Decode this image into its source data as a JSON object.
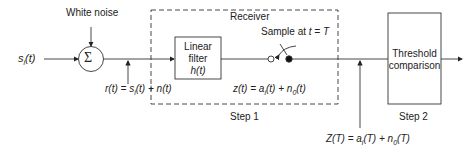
{
  "labels": {
    "white_noise": "White noise",
    "input_signal": "s",
    "input_sub": "i",
    "input_arg": "(t)",
    "sum_symbol": "Σ",
    "receiver": "Receiver",
    "sample": "Sample at ",
    "sample_eq": "t = T",
    "filter_line1": "Linear",
    "filter_line2": "filter",
    "filter_line3": "h(t)",
    "threshold_line1": "Threshold",
    "threshold_line2": "comparison",
    "r_eq_a": "r(t) = s",
    "r_eq_sub": "i",
    "r_eq_b": "(t) + n(t)",
    "z_eq_a": "z(t) = a",
    "z_eq_sub": "i",
    "z_eq_b": "(t) + n",
    "z_eq_sub2": "0",
    "z_eq_c": "(t)",
    "Z_eq_a": "Z(T) = a",
    "Z_eq_sub": "i",
    "Z_eq_b": "(T) + n",
    "Z_eq_sub2": "0",
    "Z_eq_c": "(T)",
    "step1": "Step 1",
    "step2": "Step 2"
  }
}
